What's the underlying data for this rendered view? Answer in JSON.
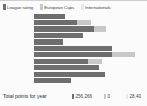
{
  "colors": {
    "league": "#6e6e6e",
    "european": "#c8c8c8",
    "internationals": "#e8e8e8",
    "background": "#fbfbfb",
    "rule": "#cfcfcf",
    "text": "#3d3d3d"
  },
  "legend": {
    "items": [
      {
        "label": "League rating",
        "color": "#6e6e6e",
        "swatch": "legend-swatch-league"
      },
      {
        "label": "European Cups",
        "color": "#c8c8c8",
        "swatch": "legend-swatch-european"
      },
      {
        "label": "Internationals",
        "color": "#e8e8e8",
        "swatch": "legend-swatch-internationals"
      }
    ]
  },
  "footer": {
    "label": "Total points for year",
    "values": [
      {
        "text": "256,266",
        "color": "#6e6e6e"
      },
      {
        "text": "0",
        "color": "#c8c8c8"
      },
      {
        "text": "28,40",
        "color": "#e8e8e8"
      }
    ]
  },
  "chart_data": {
    "type": "bar",
    "orientation": "horizontal",
    "stacked": true,
    "title": "",
    "xlabel": "",
    "ylabel": "",
    "grid": false,
    "legend_position": "top-left",
    "categories": [
      "1",
      "2",
      "3",
      "4",
      "5",
      "6",
      "7",
      "8",
      "9",
      "10",
      "11"
    ],
    "series": [
      {
        "name": "League rating",
        "color": "#6e6e6e",
        "values": [
          32,
          44,
          61,
          50,
          30,
          79,
          79,
          55,
          66,
          72,
          38
        ]
      },
      {
        "name": "European Cups",
        "color": "#c8c8c8",
        "values": [
          0,
          14,
          12,
          0,
          0,
          0,
          24,
          14,
          0,
          0,
          0
        ]
      },
      {
        "name": "Internationals",
        "color": "#e8e8e8",
        "values": [
          0,
          0,
          0,
          0,
          0,
          0,
          0,
          0,
          0,
          0,
          0
        ]
      }
    ],
    "xlim": [
      0,
      113
    ],
    "bar_origin_px": 34
  }
}
